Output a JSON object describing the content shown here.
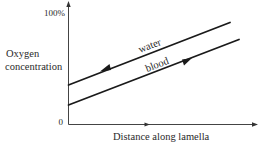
{
  "diagram": {
    "y_axis": {
      "label_line1": "Oxygen",
      "label_line2": "concentration",
      "top_tick": "100%",
      "bottom_tick": "0"
    },
    "x_axis": {
      "label": "Distance along lamella"
    },
    "series": [
      {
        "name": "water",
        "label": "water",
        "flow_direction": "left",
        "start": {
          "distance": 0,
          "oxygen_pct": 32
        },
        "end": {
          "distance": 0.86,
          "oxygen_pct": 84
        }
      },
      {
        "name": "blood",
        "label": "blood",
        "flow_direction": "right",
        "start": {
          "distance": 0,
          "oxygen_pct": 16
        },
        "end": {
          "distance": 0.91,
          "oxygen_pct": 70
        }
      }
    ],
    "colors": {
      "line": "#1a1a1a",
      "axis": "#444444",
      "text": "#2a2a2a",
      "background": "#ffffff"
    }
  }
}
